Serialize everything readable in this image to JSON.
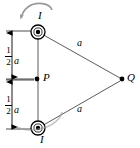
{
  "figure": {
    "type": "physics-diagram",
    "background_color": "#ffffff",
    "stroke_color": "#000000",
    "guide_color": "#b3b3b3"
  },
  "labels": {
    "current_top": "I",
    "current_bottom": "I",
    "point_p": "P",
    "point_q": "Q",
    "side_top": "a",
    "side_bottom": "a",
    "half_a_top": {
      "numerator": "1",
      "denominator": "2",
      "unit": "a"
    },
    "half_a_bottom": {
      "numerator": "1",
      "denominator": "2",
      "unit": "a"
    }
  },
  "geometry": {
    "wire_top": {
      "x": 38,
      "y": 32
    },
    "wire_bottom": {
      "x": 38,
      "y": 128
    },
    "point_p": {
      "x": 37,
      "y": 79
    },
    "point_q": {
      "x": 122,
      "y": 79
    },
    "dimension_line_x": 12,
    "wire_symbol": "current-out-of-page",
    "wire_outer_radius": 7,
    "wire_inner_radius": 2.6
  },
  "annotations": {
    "rotation_arrow_top": "counterclockwise-curved-arrow",
    "rotation_arrow_bottom": "counterclockwise-curved-arrow"
  }
}
